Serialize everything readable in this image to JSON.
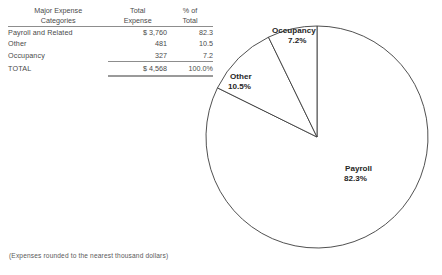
{
  "table": {
    "headers": {
      "category": [
        "Major Expense",
        "Categories"
      ],
      "total_expense": [
        "Total",
        "Expense"
      ],
      "percent": [
        "% of",
        "Total"
      ]
    },
    "rows": [
      {
        "category": "Payroll and Related",
        "total": "$ 3,760",
        "percent": "82.3"
      },
      {
        "category": "Other",
        "total": "481",
        "percent": "10.5"
      },
      {
        "category": "Occupancy",
        "total": "327",
        "percent": "7.2"
      }
    ],
    "total_row": {
      "category": "TOTAL",
      "total": "$ 4,568",
      "percent": "100.0%"
    }
  },
  "footnote": "(Expenses rounded to the nearest thousand dollars)",
  "chart_data": {
    "type": "pie",
    "title": "",
    "labels": [
      "Occupancy",
      "Other",
      "Payroll"
    ],
    "values": [
      7.2,
      10.5,
      82.3
    ],
    "value_labels": [
      "7.2%",
      "10.5%",
      "82.3%"
    ],
    "amounts": [
      327,
      481,
      3760
    ],
    "total_amount": 4568,
    "units": "thousand dollars",
    "start_angle_deg": 90,
    "direction": "counterclockwise",
    "legend": "none",
    "slice_labels": [
      {
        "name": "Occupancy",
        "value": "7.2%",
        "x": 272,
        "y": 30
      },
      {
        "name": "Other",
        "value": "10.5%",
        "x": 230,
        "y": 76
      },
      {
        "name": "Payroll",
        "value": "82.3%",
        "x": 345,
        "y": 168
      }
    ],
    "geometry": {
      "cx": 317,
      "cy": 137,
      "r": 111
    },
    "stroke_color": "#3c3c3c",
    "fill_color": "#ffffff"
  }
}
